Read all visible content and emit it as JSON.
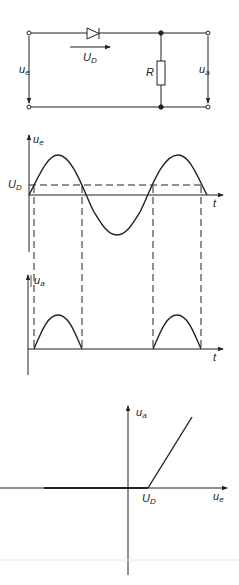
{
  "circuit": {
    "diode_voltage_label": "U",
    "diode_voltage_sub": "D",
    "input_label": "u",
    "input_sub": "e",
    "output_label": "u",
    "output_sub": "a",
    "resistor_label": "R"
  },
  "input_graph": {
    "y_label": "u",
    "y_sub": "e",
    "x_label": "t",
    "threshold_label": "U",
    "threshold_sub": "D"
  },
  "output_graph": {
    "y_label": "u",
    "y_sub": "a",
    "x_label": "t"
  },
  "transfer_graph": {
    "y_label": "u",
    "y_sub": "a",
    "x_label": "u",
    "x_sub": "e",
    "knee_label": "U",
    "knee_sub": "D"
  },
  "colors": {
    "ink": "#222222",
    "faint_line": "#e6e6e6"
  }
}
